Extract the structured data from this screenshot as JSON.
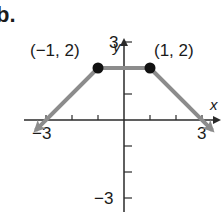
{
  "problem_label": "b.",
  "chart_data": {
    "type": "line",
    "title": "",
    "xlabel": "x",
    "ylabel": "y",
    "xlim": [
      -3.3,
      3.6
    ],
    "ylim": [
      -3.5,
      3.5
    ],
    "x_ticks": [
      -3,
      -2,
      -1,
      1,
      2,
      3
    ],
    "y_ticks": [
      -3,
      -2,
      -1,
      1,
      2,
      3
    ],
    "x_tick_labels": {
      "-3": "−3",
      "3": "3"
    },
    "y_tick_labels": {
      "3": "3",
      "-3": "−3"
    },
    "series": [
      {
        "name": "piecewise",
        "points": [
          [
            -3.4,
            -0.4
          ],
          [
            -1,
            2
          ],
          [
            1,
            2
          ],
          [
            3.4,
            -0.4
          ]
        ],
        "arrow_ends": true,
        "color": "#8c8c8c"
      }
    ],
    "marked_points": [
      {
        "x": -1,
        "y": 2,
        "label": "(−1, 2)",
        "filled": true
      },
      {
        "x": 1,
        "y": 2,
        "label": "(1, 2)",
        "filled": true
      }
    ],
    "grid": false
  },
  "colors": {
    "axis": "#2a2a2a",
    "curve": "#8c8c8c",
    "point": "#111111"
  }
}
